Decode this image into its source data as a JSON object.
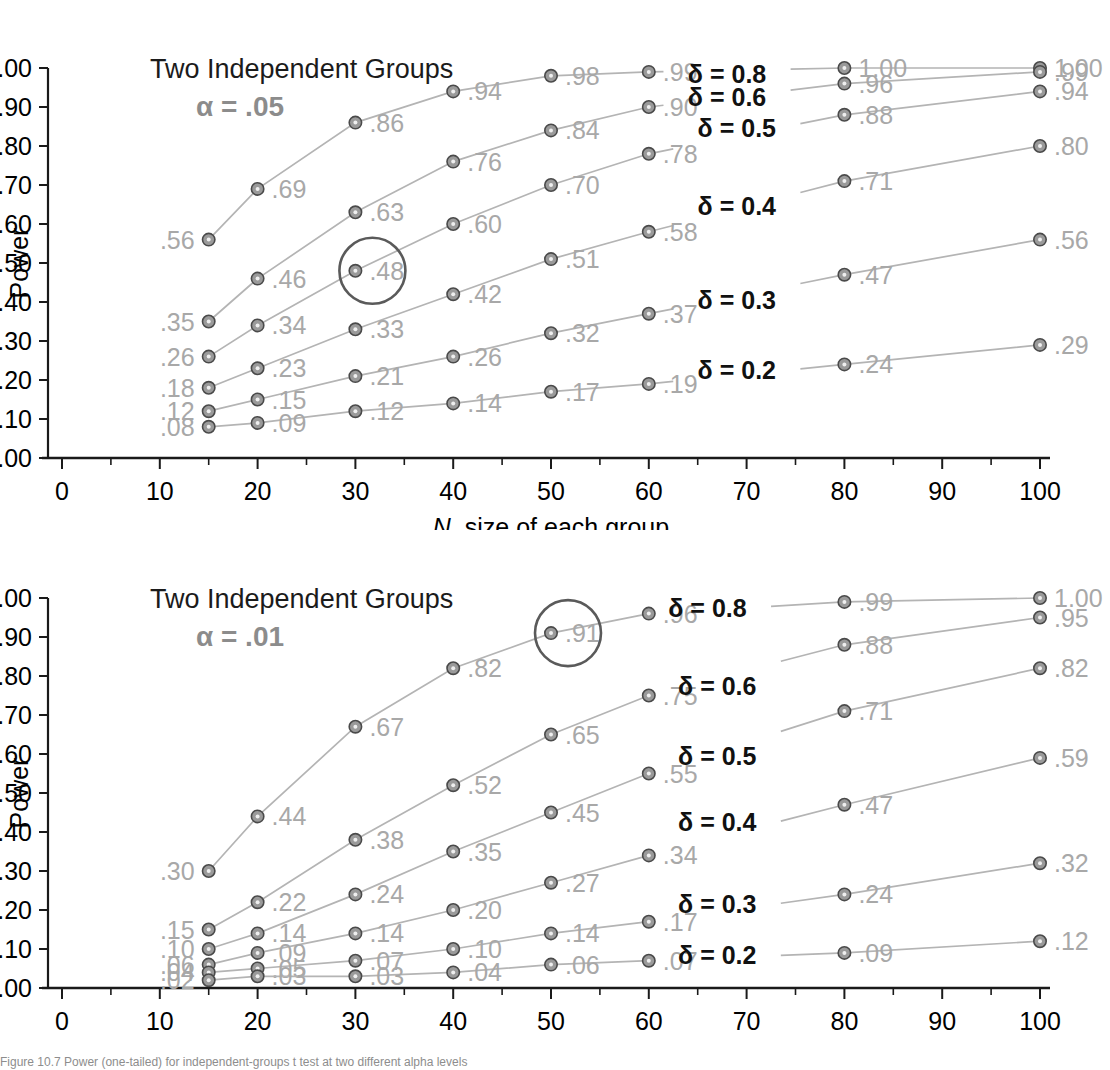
{
  "figure": {
    "xlabel_italic": "N",
    "xlabel_rest": ", size of each group",
    "ylabel": "Power",
    "caption": "Figure 10.7 Power (one-tailed) for independent-groups t test at two different alpha levels"
  },
  "axes": {
    "x_ticks": [
      "0",
      "10",
      "20",
      "30",
      "40",
      "50",
      "60",
      "70",
      "80",
      "90",
      "100"
    ],
    "y_ticks": [
      "1.00",
      ".90",
      ".80",
      ".70",
      ".60",
      ".50",
      ".40",
      ".30",
      ".20",
      ".10",
      ".00"
    ],
    "xlim": [
      0,
      100
    ],
    "ylim": [
      0,
      1
    ]
  },
  "colors": {
    "marker_fill": "#9a9a9a",
    "marker_stroke": "#4a4a4a",
    "line": "#b4b4b4",
    "value_label": "#a8a8a8",
    "alpha_text": "#8c8c8c",
    "delta_text": "#111111",
    "axis": "#1a1a1a",
    "highlight_circle": "#5a5a5a"
  },
  "chart_data": [
    {
      "type": "line",
      "panel_id": "top",
      "title": "Two Independent Groups",
      "alpha_label": "α = .05",
      "xlabel": "N, size of each group",
      "ylabel": "Power",
      "xlim": [
        0,
        100
      ],
      "ylim": [
        0,
        1
      ],
      "grid": false,
      "legend_position": "inline-right",
      "x": [
        15,
        20,
        30,
        40,
        50,
        60,
        80,
        100
      ],
      "series": [
        {
          "name": "δ = 0.8",
          "values": [
            0.56,
            0.69,
            0.86,
            0.94,
            0.98,
            0.99,
            1.0,
            1.0
          ],
          "labels": [
            ".56",
            ".69",
            ".86",
            ".94",
            ".98",
            ".99",
            "1.00",
            "1.00"
          ],
          "label_side": [
            "left",
            "right",
            "right",
            "right",
            "right",
            "right",
            "right",
            "right"
          ],
          "delta_label": "δ = 0.8",
          "delta_at_x": 68,
          "delta_at_y": 0.985
        },
        {
          "name": "δ = 0.6",
          "values": [
            0.35,
            0.46,
            0.63,
            0.76,
            0.84,
            0.9,
            0.96,
            0.99
          ],
          "labels": [
            ".35",
            ".46",
            ".63",
            ".76",
            ".84",
            ".90",
            ".96",
            ".99"
          ],
          "label_side": [
            "left",
            "right",
            "right",
            "right",
            "right",
            "right",
            "right",
            "right"
          ],
          "delta_label": "δ = 0.6",
          "delta_at_x": 68,
          "delta_at_y": 0.925
        },
        {
          "name": "δ = 0.5",
          "values": [
            0.26,
            0.34,
            0.48,
            0.6,
            0.7,
            0.78,
            0.88,
            0.94
          ],
          "labels": [
            ".26",
            ".34",
            ".48",
            ".60",
            ".70",
            ".78",
            ".88",
            ".94"
          ],
          "label_side": [
            "left",
            "right",
            "right",
            "right",
            "right",
            "right",
            "right",
            "right"
          ],
          "delta_label": "δ = 0.5",
          "delta_at_x": 69,
          "delta_at_y": 0.845
        },
        {
          "name": "δ = 0.4",
          "values": [
            0.18,
            0.23,
            0.33,
            0.42,
            0.51,
            0.58,
            0.71,
            0.8
          ],
          "labels": [
            ".18",
            ".23",
            ".33",
            ".42",
            ".51",
            ".58",
            ".71",
            ".80"
          ],
          "label_side": [
            "left",
            "right",
            "right",
            "right",
            "right",
            "right",
            "right",
            "right"
          ],
          "delta_label": "δ = 0.4",
          "delta_at_x": 69,
          "delta_at_y": 0.645
        },
        {
          "name": "δ = 0.3",
          "values": [
            0.12,
            0.15,
            0.21,
            0.26,
            0.32,
            0.37,
            0.47,
            0.56
          ],
          "labels": [
            ".12",
            ".15",
            ".21",
            ".26",
            ".32",
            ".37",
            ".47",
            ".56"
          ],
          "label_side": [
            "left",
            "right",
            "right",
            "right",
            "right",
            "right",
            "right",
            "right"
          ],
          "delta_label": "δ = 0.3",
          "delta_at_x": 69,
          "delta_at_y": 0.405
        },
        {
          "name": "δ = 0.2",
          "values": [
            0.08,
            0.09,
            0.12,
            0.14,
            0.17,
            0.19,
            0.24,
            0.29
          ],
          "labels": [
            ".08",
            ".09",
            ".12",
            ".14",
            ".17",
            ".19",
            ".24",
            ".29"
          ],
          "label_side": [
            "left",
            "right",
            "right",
            "right",
            "right",
            "right",
            "right",
            "right"
          ],
          "delta_label": "δ = 0.2",
          "delta_at_x": 69,
          "delta_at_y": 0.225
        }
      ],
      "highlight": {
        "x": 30,
        "y": 0.48,
        "label": ".48"
      }
    },
    {
      "type": "line",
      "panel_id": "bottom",
      "title": "Two Independent Groups",
      "alpha_label": "α = .01",
      "xlabel": "N, size of each group",
      "ylabel": "Power",
      "xlim": [
        0,
        100
      ],
      "ylim": [
        0,
        1
      ],
      "grid": false,
      "legend_position": "inline-right",
      "x": [
        15,
        20,
        30,
        40,
        50,
        60,
        80,
        100
      ],
      "series": [
        {
          "name": "δ = 0.8",
          "values": [
            0.3,
            0.44,
            0.67,
            0.82,
            0.91,
            0.96,
            0.99,
            1.0
          ],
          "labels": [
            ".30",
            ".44",
            ".67",
            ".82",
            ".91",
            ".96",
            ".99",
            "1.00"
          ],
          "label_side": [
            "left",
            "right",
            "right",
            "right",
            "right",
            "right",
            "right",
            "right"
          ],
          "delta_label": "δ = 0.8",
          "delta_at_x": 66,
          "delta_at_y": 0.975
        },
        {
          "name": "δ = 0.6",
          "values": [
            0.15,
            0.22,
            0.38,
            0.52,
            0.65,
            0.75,
            0.88,
            0.95
          ],
          "labels": [
            ".15",
            ".22",
            ".38",
            ".52",
            ".65",
            ".75",
            ".88",
            ".95"
          ],
          "label_side": [
            "left",
            "right",
            "right",
            "right",
            "right",
            "right",
            "right",
            "right"
          ],
          "delta_label": "δ = 0.6",
          "delta_at_x": 67,
          "delta_at_y": 0.775
        },
        {
          "name": "δ = 0.5",
          "values": [
            0.1,
            0.14,
            0.24,
            0.35,
            0.45,
            0.55,
            0.71,
            0.82
          ],
          "labels": [
            ".10",
            ".14",
            ".24",
            ".35",
            ".45",
            ".55",
            ".71",
            ".82"
          ],
          "label_side": [
            "left",
            "right",
            "right",
            "right",
            "right",
            "right",
            "right",
            "right"
          ],
          "delta_label": "δ = 0.5",
          "delta_at_x": 67,
          "delta_at_y": 0.595
        },
        {
          "name": "δ = 0.4",
          "values": [
            0.06,
            0.09,
            0.14,
            0.2,
            0.27,
            0.34,
            0.47,
            0.59
          ],
          "labels": [
            ".06",
            ".09",
            ".14",
            ".20",
            ".27",
            ".34",
            ".47",
            ".59"
          ],
          "label_side": [
            "left",
            "right",
            "right",
            "right",
            "right",
            "right",
            "right",
            "right"
          ],
          "delta_label": "δ = 0.4",
          "delta_at_x": 67,
          "delta_at_y": 0.425
        },
        {
          "name": "δ = 0.3",
          "values": [
            0.04,
            0.05,
            0.07,
            0.1,
            0.14,
            0.17,
            0.24,
            0.32
          ],
          "labels": [
            ".04",
            ".05",
            ".07",
            ".10",
            ".14",
            ".17",
            ".24",
            ".32"
          ],
          "label_side": [
            "left",
            "right",
            "right",
            "right",
            "right",
            "right",
            "right",
            "right"
          ],
          "delta_label": "δ = 0.3",
          "delta_at_x": 67,
          "delta_at_y": 0.215
        },
        {
          "name": "δ = 0.2",
          "values": [
            0.02,
            0.03,
            0.03,
            0.04,
            0.06,
            0.07,
            0.09,
            0.12
          ],
          "labels": [
            ".02",
            ".03",
            ".03",
            ".04",
            ".06",
            ".07",
            ".09",
            ".12"
          ],
          "label_side": [
            "left",
            "right",
            "right",
            "right",
            "right",
            "right",
            "right",
            "right"
          ],
          "delta_label": "δ = 0.2",
          "delta_at_x": 67,
          "delta_at_y": 0.085
        },
        {
          "name": "δ = 0.6 low marker",
          "values": [],
          "labels": [],
          "label_side": []
        }
      ],
      "highlight": {
        "x": 50,
        "y": 0.91,
        "label": ".91"
      }
    }
  ]
}
